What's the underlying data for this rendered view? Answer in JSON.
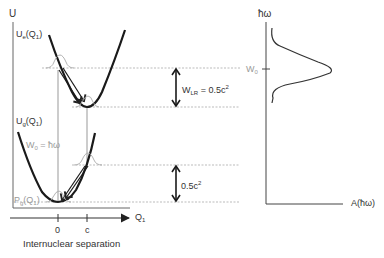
{
  "left_panel": {
    "y_axis_label": "U",
    "x_axis_label": "Q",
    "x_axis_label_sub": "1",
    "x_caption": "Internuclear separation",
    "x_ticks": [
      "0",
      "c"
    ],
    "curve_excited_label": "U",
    "curve_excited_sub": "e",
    "curve_excited_arg": "(Q",
    "curve_excited_arg_sub": "1",
    "curve_excited_close": ")",
    "curve_ground_label": "U",
    "curve_ground_sub": "g",
    "curve_ground_arg": "(Q",
    "curve_ground_arg_sub": "1",
    "curve_ground_close": ")",
    "transition_label": "W",
    "transition_sub": "0",
    "transition_eq": " = ħω",
    "distribution_label": "P",
    "distribution_sub": "g",
    "distribution_arg": "(Q",
    "distribution_arg_sub": "1",
    "distribution_close": ")",
    "reorg_label": "W",
    "reorg_sub": "LR",
    "reorg_eq": " = 0.5c",
    "reorg_sup": "2",
    "ground_gap_label": "0.5c",
    "ground_gap_sup": "2"
  },
  "right_panel": {
    "y_axis_label": "ħω",
    "x_axis_label": "A(ħω)",
    "peak_label": "W",
    "peak_sub": "0"
  },
  "colors": {
    "curve": "#1a1a1a",
    "axis": "#555555",
    "grey_lines": "#a8a8a8",
    "grey_text": "#9a9a9a",
    "text": "#333333"
  }
}
